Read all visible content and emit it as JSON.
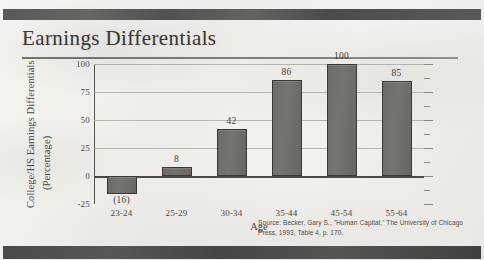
{
  "slide": {
    "title": "Earnings Differentials",
    "source_note": "Source: Becker, Gary S., \"Human Capital,\" The University of Chicago Press, 1993, Table 4, p. 170.",
    "colors": {
      "bar_fill": "#6e6c68",
      "bar_border": "#3a3936",
      "text": "#3f3d3a",
      "gridline": "#adaaa5",
      "axis": "#55534f",
      "band": "#4f4e4c",
      "page": "#f1efec"
    }
  },
  "chart_data": {
    "type": "bar",
    "title": "Earnings Differentials",
    "xlabel": "Age",
    "ylabel": "College/HS Earnings Differentials (Percentage)",
    "ylabel_line1": "College/HS Earnings Differentials",
    "ylabel_line2": "(Percentage)",
    "categories": [
      "23-24",
      "25-29",
      "30-34",
      "35-44",
      "45-54",
      "55-64"
    ],
    "values": [
      -16,
      8,
      42,
      86,
      100,
      85
    ],
    "value_labels": [
      "(16)",
      "8",
      "42",
      "86",
      "100",
      "85"
    ],
    "ylim": [
      -25,
      100
    ],
    "yticks": [
      100,
      75,
      50,
      25,
      0,
      -25
    ],
    "ytick_labels": [
      "100",
      "75",
      "50",
      "25",
      "0",
      "-25"
    ],
    "grid": true,
    "legend": "none",
    "series": [
      {
        "name": "College/HS Earnings Differentials",
        "values": [
          -16,
          8,
          42,
          86,
          100,
          85
        ]
      }
    ]
  }
}
